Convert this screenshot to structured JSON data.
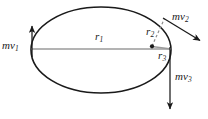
{
  "figure": {
    "kind": "orbit-momentum-diagram",
    "background_color": "#ffffff",
    "width": 208,
    "height": 119
  },
  "ellipse": {
    "name": "orbit-path",
    "center_x": 101,
    "center_y": 50,
    "radius_x": 70,
    "radius_y": 43,
    "stroke_color": "#1a1a1a",
    "stroke_width": 1.6,
    "fill": "none"
  },
  "focus_point": {
    "name": "focus-dot",
    "x": 152,
    "y": 46,
    "radius": 2.1,
    "color": "#1a1a1a"
  },
  "radii": [
    {
      "id": "r1",
      "label": "r",
      "subscript": "1",
      "style": "solid",
      "color": "#9a9a9a",
      "from_x": 31,
      "from_y": 49,
      "to_x": 171,
      "to_y": 49
    },
    {
      "id": "r2",
      "label": "r",
      "subscript": "2",
      "style": "dashed",
      "color": "#8c8c8c",
      "from_x": 152,
      "from_y": 46,
      "to_x": 164,
      "to_y": 19
    },
    {
      "id": "r3",
      "label": "r",
      "subscript": "3",
      "style": "solid",
      "color": "#9a9a9a",
      "from_x": 152,
      "from_y": 46,
      "to_x": 171,
      "to_y": 49
    }
  ],
  "momentum_vectors": [
    {
      "id": "mv1",
      "label": "mv",
      "subscript": "1",
      "color": "#1a1a1a",
      "from_x": 32,
      "from_y": 56,
      "to_x": 32,
      "to_y": 26,
      "direction": "up"
    },
    {
      "id": "mv2",
      "label": "mv",
      "subscript": "2",
      "color": "#1a1a1a",
      "from_x": 163,
      "from_y": 18,
      "to_x": 201,
      "to_y": 41,
      "direction": "down-right"
    },
    {
      "id": "mv3",
      "label": "mv",
      "subscript": "3",
      "color": "#1a1a1a",
      "from_x": 170,
      "from_y": 47,
      "to_x": 170,
      "to_y": 110,
      "direction": "down"
    }
  ],
  "labels": {
    "mv1": {
      "text": "mv",
      "sub": "1"
    },
    "mv2": {
      "text": "mv",
      "sub": "2"
    },
    "mv3": {
      "text": "mv",
      "sub": "3"
    },
    "r1": {
      "text": "r",
      "sub": "1"
    },
    "r2": {
      "text": "r",
      "sub": "2"
    },
    "r3": {
      "text": "r",
      "sub": "3"
    }
  }
}
